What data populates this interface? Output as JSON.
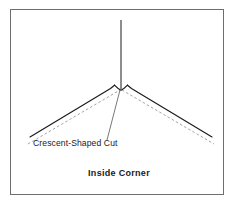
{
  "figure": {
    "caption": "Inside Corner",
    "annotation_label": "Crescent-Shaped Cut",
    "frame": {
      "x": 10,
      "y": 9,
      "width": 214,
      "height": 186,
      "border_color": "#6e6e6e"
    },
    "colors": {
      "background": "#ffffff",
      "line": "#1a1a1a",
      "dashed_line": "#9a9a9a",
      "text": "#1a1a1a",
      "frame": "#6e6e6e"
    },
    "elements": [
      {
        "name": "vertical-reference-line",
        "style": "solid",
        "points": "121,20 121,88"
      },
      {
        "name": "left-arm-solid",
        "style": "solid",
        "points": "30,137 110,88"
      },
      {
        "name": "left-apex-shoulder",
        "style": "solid",
        "points": "110,88 114,85"
      },
      {
        "name": "crescent-notch",
        "style": "solid-curve",
        "points": "114,85 121,90 128,85"
      },
      {
        "name": "right-apex-shoulder",
        "style": "solid",
        "points": "128,85 132,88"
      },
      {
        "name": "right-arm-solid",
        "style": "solid",
        "points": "132,88 212,137"
      },
      {
        "name": "left-arm-dashed",
        "style": "dashed",
        "points": "28,144 120,90"
      },
      {
        "name": "right-arm-dashed",
        "style": "dashed",
        "points": "122,90 214,144"
      },
      {
        "name": "leader-line",
        "style": "solid",
        "points": "120,90 107,140"
      }
    ]
  }
}
